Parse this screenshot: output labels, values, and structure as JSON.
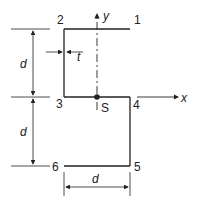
{
  "diagram": {
    "type": "z-section cross-section",
    "points": [
      {
        "id": "1",
        "label": "1"
      },
      {
        "id": "2",
        "label": "2"
      },
      {
        "id": "3",
        "label": "3"
      },
      {
        "id": "4",
        "label": "4"
      },
      {
        "id": "5",
        "label": "5"
      },
      {
        "id": "6",
        "label": "6"
      }
    ],
    "centroid_label": "S",
    "axes": {
      "x": "x",
      "y": "y"
    },
    "dimensions": {
      "upper_height": "d",
      "lower_height": "d",
      "bottom_width": "d",
      "thickness": "t"
    },
    "colors": {
      "line": "#222222",
      "background": "#ffffff"
    }
  }
}
